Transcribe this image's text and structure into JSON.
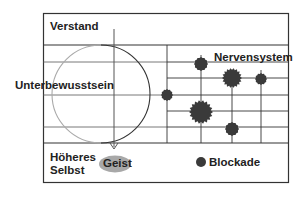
{
  "diagram": {
    "labels": {
      "top_region": "Verstand",
      "middle_region": "Unterbewusstsein",
      "bottom_region_line1": "Höheres",
      "bottom_region_line2": "Selbst",
      "right_grid": "Nervensystem",
      "arrow_target": "Geist",
      "legend": "Blockade"
    },
    "colors": {
      "line": "#333333",
      "blockade": "#3a3a3a",
      "geist_fill": "#a8a8a8",
      "circle_left": "#aaaaaa",
      "circle_right": "#333333"
    },
    "blockades": [
      {
        "x": 201,
        "y": 64,
        "r": 7,
        "spiky": false
      },
      {
        "x": 232,
        "y": 78,
        "r": 10,
        "spiky": true
      },
      {
        "x": 261,
        "y": 79,
        "r": 6,
        "spiky": false
      },
      {
        "x": 167,
        "y": 95,
        "r": 6,
        "spiky": false
      },
      {
        "x": 201,
        "y": 112,
        "r": 12,
        "spiky": true
      },
      {
        "x": 232,
        "y": 129,
        "r": 7,
        "spiky": false
      }
    ]
  }
}
